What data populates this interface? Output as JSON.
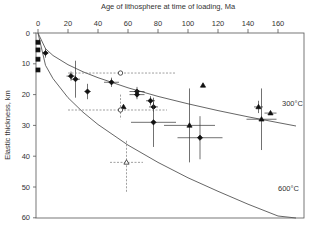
{
  "chart_data": {
    "type": "scatter",
    "title": "",
    "xlabel": "Age of lithosphere at time of loading, Ma",
    "ylabel": "Elastic thickness, km",
    "xlim": [
      0,
      178
    ],
    "ylim": [
      60,
      0
    ],
    "x_axis_position": "top",
    "y_inverted": true,
    "xticks": [
      0,
      20,
      40,
      60,
      80,
      100,
      120,
      140,
      160
    ],
    "yticks": [
      0,
      10,
      20,
      30,
      40,
      50,
      60
    ],
    "grid": false,
    "curves": [
      {
        "name": "300°C",
        "label": "300°C",
        "style": "solid",
        "x": [
          0,
          5,
          10,
          20,
          30,
          40,
          60,
          80,
          100,
          120,
          140,
          160,
          172
        ],
        "y": [
          0,
          5.1,
          7.3,
          10.3,
          12.6,
          14.5,
          17.8,
          20.6,
          23.0,
          25.2,
          27.2,
          29.1,
          30.2
        ]
      },
      {
        "name": "600°C",
        "label": "600°C",
        "style": "solid",
        "x": [
          0,
          5,
          10,
          20,
          30,
          40,
          60,
          80,
          100,
          120,
          140,
          160,
          172
        ],
        "y": [
          0,
          10.5,
          14.8,
          21.0,
          25.7,
          29.7,
          36.4,
          42.0,
          47.0,
          51.4,
          55.6,
          59.4,
          61.6
        ]
      }
    ],
    "series": [
      {
        "name": "zero-age squares",
        "marker": "square",
        "filled": true,
        "points": [
          {
            "x": 0,
            "y": 3
          },
          {
            "x": 0,
            "y": 5.5
          },
          {
            "x": 0,
            "y": 8.5
          },
          {
            "x": 0,
            "y": 12
          }
        ]
      },
      {
        "name": "filled diamonds",
        "marker": "diamond",
        "filled": true,
        "points": [
          {
            "x": 5,
            "y": 6.5,
            "xerr": 2,
            "yerr": 1.5
          },
          {
            "x": 22,
            "y": 14,
            "xerr": 3,
            "yerr": 1.5
          },
          {
            "x": 25,
            "y": 15,
            "xerr": 3,
            "yerr": 6
          },
          {
            "x": 33,
            "y": 19,
            "xerr": 2,
            "yerr": 2.5
          },
          {
            "x": 49,
            "y": 16,
            "xerr": 5,
            "yerr": 1.5
          },
          {
            "x": 66,
            "y": 19,
            "xerr": 5,
            "yerr": 1.5
          },
          {
            "x": 66,
            "y": 20,
            "xerr": 5,
            "yerr": 1.5
          },
          {
            "x": 75,
            "y": 22,
            "xerr": 3,
            "yerr": 1.5
          },
          {
            "x": 77,
            "y": 24,
            "xerr": 3,
            "yerr": 1.5
          },
          {
            "x": 77,
            "y": 29,
            "xerr": 15,
            "yerr": 8
          },
          {
            "x": 108,
            "y": 34,
            "xerr": 15,
            "yerr": 7
          }
        ]
      },
      {
        "name": "filled triangles",
        "marker": "triangle",
        "filled": true,
        "points": [
          {
            "x": 57,
            "y": 24
          },
          {
            "x": 101,
            "y": 30,
            "xerr": 17,
            "yerr": 12
          },
          {
            "x": 110,
            "y": 17
          },
          {
            "x": 147,
            "y": 24,
            "xerr": 3,
            "yerr": 2
          },
          {
            "x": 155,
            "y": 26,
            "xerr": 4
          },
          {
            "x": 149,
            "y": 28,
            "xerr": 10,
            "yerr": 10
          }
        ]
      },
      {
        "name": "open circles",
        "marker": "circle",
        "filled": false,
        "dashed_errors": true,
        "points": [
          {
            "x": 55,
            "y": 13,
            "xlo": 20,
            "xhi": 92
          },
          {
            "x": 55,
            "y": 25,
            "xlo": 20,
            "xhi": 86,
            "ylo": 20,
            "yhi": 28
          }
        ]
      },
      {
        "name": "open triangle",
        "marker": "triangle",
        "filled": false,
        "dashed_errors": true,
        "points": [
          {
            "x": 59,
            "y": 42,
            "xlo": 48,
            "xhi": 70,
            "ylo": 35,
            "yhi": 52
          }
        ]
      }
    ]
  },
  "labels": {
    "xlabel": "Age of lithosphere at time of loading, Ma",
    "ylabel": "Elastic thickness, km",
    "curve300": "300°C",
    "curve600": "600°C",
    "xticks": [
      "0",
      "20",
      "40",
      "60",
      "80",
      "100",
      "120",
      "140",
      "160"
    ],
    "yticks": [
      "0",
      "10",
      "20",
      "30",
      "40",
      "50",
      "60"
    ]
  }
}
